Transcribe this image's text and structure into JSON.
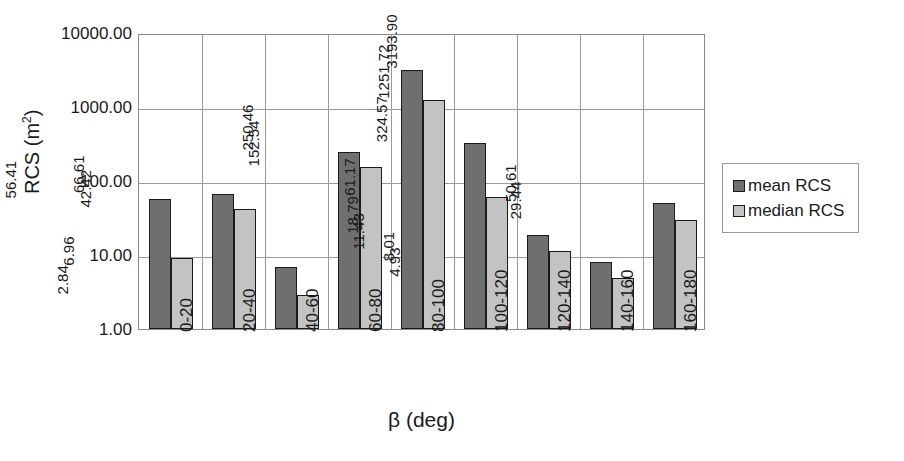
{
  "chart_data": {
    "type": "bar",
    "title": "",
    "xlabel": "β (deg)",
    "ylabel": "RCS (m²)",
    "ylabel_base": "RCS (m",
    "ylabel_sup": "2",
    "ylabel_tail": ")",
    "yscale": "log",
    "ylim": [
      1,
      10000
    ],
    "ytick_labels": [
      "10000.00",
      "1000.00",
      "100.00",
      "10.00",
      "1.00"
    ],
    "ytick_values": [
      10000,
      1000,
      100,
      10,
      1
    ],
    "grid": "horizontal-and-category-separators",
    "legend_position": "right-outside",
    "categories": [
      "0-20",
      "20-40",
      "40-60",
      "60-80",
      "80-100",
      "100-120",
      "120-140",
      "140-160",
      "160-180"
    ],
    "series": [
      {
        "name": "mean RCS",
        "color": "#6f6f6f",
        "values": [
          56.41,
          66.61,
          6.96,
          250.46,
          3193.9,
          324.57,
          18.79,
          8.01,
          50.61
        ],
        "labels": [
          "56.41",
          "66.61",
          "6.96",
          "250.46",
          "3193.90",
          "324.57",
          "18.79",
          "8.01",
          "50.61"
        ]
      },
      {
        "name": "median RCS",
        "color": "#c3c3c3",
        "values": [
          9.23,
          42.42,
          2.84,
          152.54,
          1251.72,
          61.17,
          11.43,
          4.93,
          29.44
        ],
        "labels": [
          "9.23",
          "42.42",
          "2.84",
          "152.54",
          "1251.72",
          "61.17",
          "11.43",
          "4.93",
          "29.44"
        ]
      }
    ]
  },
  "legend": {
    "items": [
      {
        "label": "mean RCS",
        "swatch": "mean"
      },
      {
        "label": "median RCS",
        "swatch": "median"
      }
    ]
  },
  "colors": {
    "mean": "#6f6f6f",
    "median": "#c3c3c3",
    "grid": "#9a9a9a",
    "outline": "#1a1a1a",
    "background": "#ffffff"
  }
}
